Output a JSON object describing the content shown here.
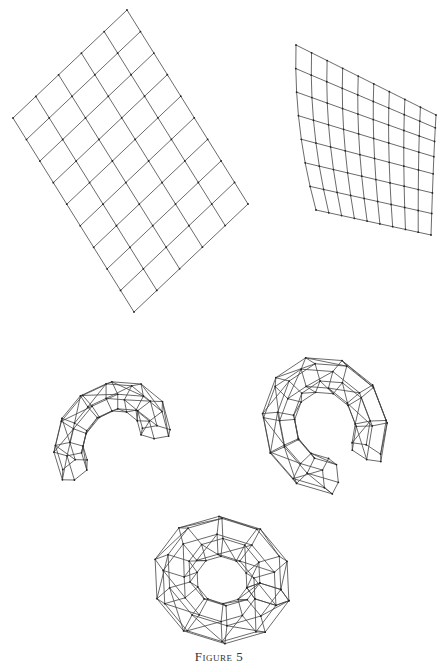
{
  "figure": {
    "caption": "Figure 5",
    "panels": [
      {
        "id": "flat-grid",
        "description": "Flat rectangular grid mesh, 5 x 9 cells, rotated"
      },
      {
        "id": "curved-sheet",
        "description": "Grid mesh curved into a cylindrical sheet"
      },
      {
        "id": "partial-torus-left",
        "description": "Polyhedral mesh bent into an open ring (C shape)"
      },
      {
        "id": "partial-torus-right",
        "description": "Polyhedral mesh nearly closed ring (C shape)"
      },
      {
        "id": "closed-torus",
        "description": "Closed polyhedral torus mesh"
      }
    ]
  },
  "grid": {
    "columns": 5,
    "rows": 9,
    "corners": {
      "left": [
        13,
        118
      ],
      "top": [
        127,
        10
      ],
      "right": [
        251,
        208
      ],
      "bottom": [
        134,
        312
      ]
    }
  }
}
